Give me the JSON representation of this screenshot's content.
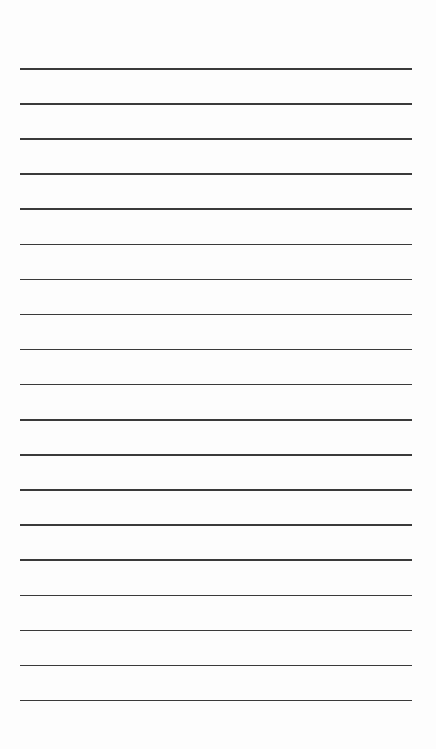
{
  "page": {
    "type": "lined-paper",
    "line_count": 19,
    "first_line_y": 68,
    "line_spacing": 35.1,
    "line_left": 20,
    "line_right": 412,
    "line_color": "#3a3a3a",
    "background": "#fdfdfd"
  }
}
